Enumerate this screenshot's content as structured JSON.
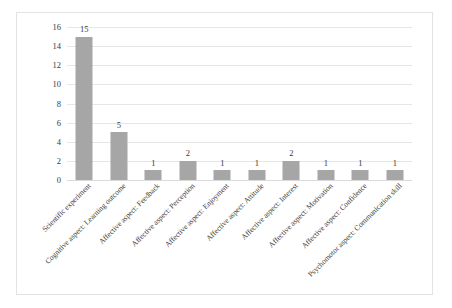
{
  "chart_data": {
    "type": "bar",
    "title": "",
    "subtitle": "",
    "xlabel": "",
    "ylabel": "",
    "ylim": [
      0,
      16
    ],
    "ytick_step": 2,
    "yticks": [
      "16",
      "14",
      "12",
      "10",
      "8",
      "6",
      "4",
      "2",
      "0"
    ],
    "grid": true,
    "legend": "none",
    "bar_color": "#a6a6a6",
    "gridline_color": "#e6e6e6",
    "border_color": "#e3e3e3",
    "categories": [
      "Scientific experiment",
      "Cognitive aspect: Learning outcome",
      "Affective aspect: Feedback",
      "Affective aspect: Perception",
      "Affective aspect: Enjoyment",
      "Affective aspect: Attitude",
      "Affective aspect: Interest",
      "Affective aspect: Motivation",
      "Affective aspect: Confidence",
      "Psychomotor aspect: Communication skill"
    ],
    "values": [
      15,
      5,
      1,
      2,
      1,
      1,
      2,
      1,
      1,
      1
    ],
    "value_labels": [
      "15",
      "5",
      "1",
      "2",
      "1",
      "1",
      "2",
      "1",
      "1",
      "1"
    ]
  }
}
